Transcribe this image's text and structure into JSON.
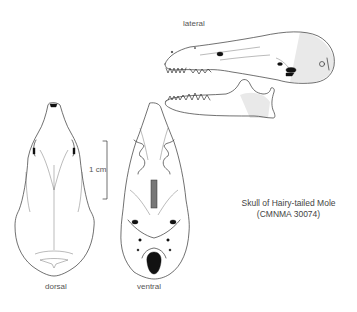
{
  "figure": {
    "caption": {
      "line1": "Skull of Hairy-tailed Mole",
      "line2": "(CMNMA 30074)"
    },
    "views": {
      "lateral": {
        "label": "lateral"
      },
      "dorsal": {
        "label": "dorsal"
      },
      "ventral": {
        "label": "ventral"
      }
    },
    "scale_bar": {
      "label": "1 cm"
    }
  }
}
